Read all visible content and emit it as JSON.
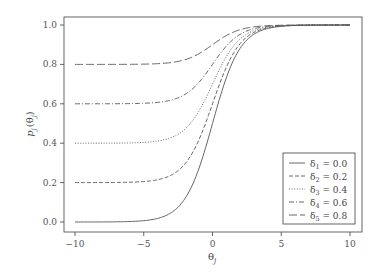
{
  "chart_data": {
    "type": "line",
    "title": "",
    "xlabel": "θ_j",
    "ylabel": "p_j(θ_j)",
    "xlim": [
      -10,
      10
    ],
    "ylim": [
      0,
      1
    ],
    "xticks": [
      -10,
      -5,
      0,
      5,
      10
    ],
    "xtick_labels": [
      "−10",
      "−5",
      "0",
      "5",
      "10"
    ],
    "yticks": [
      0.0,
      0.2,
      0.4,
      0.6,
      0.8,
      1.0
    ],
    "ytick_labels": [
      "0.0",
      "0.2",
      "0.4",
      "0.6",
      "0.8",
      "1.0"
    ],
    "grid": false,
    "legend_position": "lower right",
    "function": "p(θ) = δ + (1 − δ) / (1 + exp(−θ))",
    "x": [
      -10,
      -8,
      -6,
      -4,
      -3,
      -2,
      -1,
      0,
      1,
      2,
      3,
      4,
      6,
      8,
      10
    ],
    "series": [
      {
        "name": "δ1 = 0.0",
        "sub": "1",
        "value": "0.0",
        "delta": 0.0,
        "dash": "none",
        "values": [
          0.0,
          0.0003,
          0.0025,
          0.018,
          0.0474,
          0.1192,
          0.2689,
          0.5,
          0.7311,
          0.8808,
          0.9526,
          0.982,
          0.9975,
          0.9997,
          1.0
        ]
      },
      {
        "name": "δ2 = 0.2",
        "sub": "2",
        "value": "0.2",
        "delta": 0.2,
        "dash": "4,2",
        "values": [
          0.2,
          0.2003,
          0.202,
          0.2144,
          0.2379,
          0.2954,
          0.4151,
          0.6,
          0.7849,
          0.9046,
          0.9621,
          0.9856,
          0.998,
          0.9997,
          1.0
        ]
      },
      {
        "name": "δ3 = 0.4",
        "sub": "3",
        "value": "0.4",
        "delta": 0.4,
        "dash": "1,1.6",
        "values": [
          0.4,
          0.4002,
          0.4015,
          0.4108,
          0.4284,
          0.4715,
          0.5613,
          0.7,
          0.8387,
          0.9285,
          0.9716,
          0.9892,
          0.9985,
          0.9998,
          1.0
        ]
      },
      {
        "name": "δ4 = 0.6",
        "sub": "4",
        "value": "0.6",
        "delta": 0.6,
        "dash": "5,2,1,2",
        "values": [
          0.6,
          0.6001,
          0.601,
          0.6072,
          0.619,
          0.6477,
          0.7076,
          0.8,
          0.8924,
          0.9523,
          0.981,
          0.9928,
          0.999,
          0.9999,
          1.0
        ]
      },
      {
        "name": "δ5 = 0.8",
        "sub": "5",
        "value": "0.8",
        "delta": 0.8,
        "dash": "8,3",
        "values": [
          0.8,
          0.8001,
          0.8005,
          0.8036,
          0.8095,
          0.8238,
          0.8538,
          0.9,
          0.9462,
          0.9762,
          0.9905,
          0.9964,
          0.9995,
          0.9999,
          1.0
        ]
      }
    ]
  },
  "axes": {
    "x_label_main": "θ",
    "x_label_sub": "j",
    "y_label_main": "p",
    "y_label_sub": "j",
    "y_label_arg": "(θ",
    "y_label_arg_sub": "j",
    "y_label_close": ")"
  },
  "legend": {
    "symbol": "δ",
    "eq": " = "
  },
  "layout": {
    "frame": {
      "left": 64,
      "top": 17,
      "right": 362,
      "bottom": 232
    },
    "x_px": {
      "min_val": -10,
      "min_px": 75,
      "max_val": 10,
      "max_px": 350
    },
    "y_px": {
      "min_val": 0,
      "min_px": 222,
      "max_val": 1,
      "max_px": 25
    },
    "legend_box": {
      "left": 283,
      "top": 153,
      "width": 72,
      "height": 71
    },
    "line_color": "#555555"
  }
}
